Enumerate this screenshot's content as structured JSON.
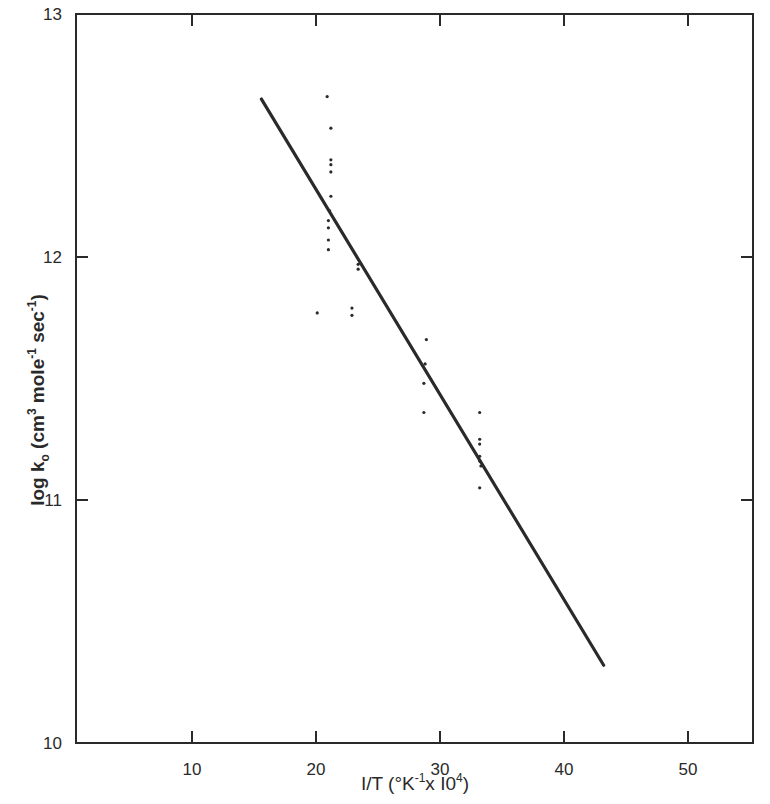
{
  "chart_data": {
    "type": "scatter",
    "title": "",
    "xlabel": "1/T (°K⁻¹ x 10⁴)",
    "ylabel": "log k₀ (cm³ mole⁻¹ sec⁻¹)",
    "xlim": [
      0,
      55.5
    ],
    "ylim": [
      10,
      13
    ],
    "grid": false,
    "legend": null,
    "x_ticks": [
      10,
      20,
      30,
      40,
      50
    ],
    "x_tick_labels": [
      "10",
      "20",
      "30",
      "40",
      "50"
    ],
    "y_ticks": [
      10,
      11,
      12,
      13
    ],
    "y_tick_labels": [
      "10",
      "11",
      "12",
      "13"
    ],
    "series": [
      {
        "name": "experimental points",
        "kind": "scatter",
        "points": [
          {
            "x": 20.9,
            "y": 12.66
          },
          {
            "x": 21.2,
            "y": 12.53
          },
          {
            "x": 21.2,
            "y": 12.4
          },
          {
            "x": 21.2,
            "y": 12.38
          },
          {
            "x": 21.2,
            "y": 12.35
          },
          {
            "x": 21.2,
            "y": 12.25
          },
          {
            "x": 21.1,
            "y": 12.19
          },
          {
            "x": 21.0,
            "y": 12.15
          },
          {
            "x": 21.0,
            "y": 12.12
          },
          {
            "x": 21.0,
            "y": 12.07
          },
          {
            "x": 21.0,
            "y": 12.03
          },
          {
            "x": 23.4,
            "y": 11.97
          },
          {
            "x": 23.4,
            "y": 11.95
          },
          {
            "x": 20.1,
            "y": 11.77
          },
          {
            "x": 22.9,
            "y": 11.79
          },
          {
            "x": 22.9,
            "y": 11.76
          },
          {
            "x": 28.9,
            "y": 11.66
          },
          {
            "x": 28.8,
            "y": 11.56
          },
          {
            "x": 28.7,
            "y": 11.48
          },
          {
            "x": 28.7,
            "y": 11.36
          },
          {
            "x": 33.2,
            "y": 11.36
          },
          {
            "x": 33.2,
            "y": 11.25
          },
          {
            "x": 33.2,
            "y": 11.23
          },
          {
            "x": 33.2,
            "y": 11.18
          },
          {
            "x": 33.2,
            "y": 11.16
          },
          {
            "x": 33.3,
            "y": 11.14
          },
          {
            "x": 33.2,
            "y": 11.05
          }
        ]
      },
      {
        "name": "fitted line",
        "kind": "line",
        "points": [
          {
            "x": 15.6,
            "y": 12.65
          },
          {
            "x": 43.2,
            "y": 10.32
          }
        ]
      }
    ]
  },
  "axes": {
    "x_title": "I/T (°K",
    "x_title_sup1": "-1",
    "x_title_mid": "x I0",
    "x_title_sup2": "4",
    "x_title_end": ")",
    "y_title": "log k",
    "y_title_sub": "o",
    "y_title_mid1": " (cm",
    "y_title_sup1": "3",
    "y_title_mid2": " mole",
    "y_title_sup2": "-1",
    "y_title_mid3": " sec",
    "y_title_sup3": "-1",
    "y_title_end": ")"
  },
  "colors": {
    "ink": "#2a2a2a",
    "background": "#ffffff"
  }
}
